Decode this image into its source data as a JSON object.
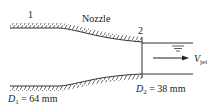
{
  "diagram": {
    "title": "Nozzle",
    "section_labels": [
      "1",
      "2"
    ],
    "inlet_diameter": {
      "symbol": "D",
      "subscript": "1",
      "value": "= 64 mm"
    },
    "outlet_diameter": {
      "symbol": "D",
      "subscript": "2",
      "value": "= 38 mm"
    },
    "jet_velocity": {
      "symbol": "V",
      "subscript": "jet"
    },
    "colors": {
      "line": "#333333",
      "background": "#ffffff"
    }
  }
}
